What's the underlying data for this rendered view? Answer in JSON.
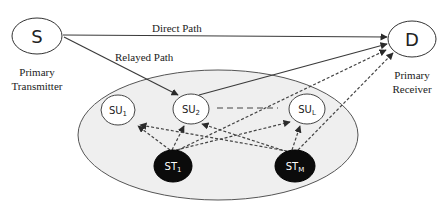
{
  "nodes": {
    "source": {
      "label": "S",
      "caption_line1": "Primary",
      "caption_line2": "Transmitter"
    },
    "destination": {
      "label": "D",
      "caption_line1": "Primary",
      "caption_line2": "Receiver"
    },
    "su1": {
      "base": "SU",
      "sub": "1"
    },
    "su2": {
      "base": "SU",
      "sub": "2"
    },
    "sul": {
      "base": "SU",
      "sub": "L"
    },
    "st1": {
      "base": "ST",
      "sub": "1"
    },
    "stm": {
      "base": "ST",
      "sub": "M"
    }
  },
  "edges": {
    "direct_path_label": "Direct Path",
    "relayed_path_label": "Relayed Path"
  },
  "colors": {
    "line": "#3a3a3a",
    "cluster_fill": "#efefef",
    "secondary_tx_fill": "#0b0b0b",
    "node_fill": "#ffffff"
  }
}
